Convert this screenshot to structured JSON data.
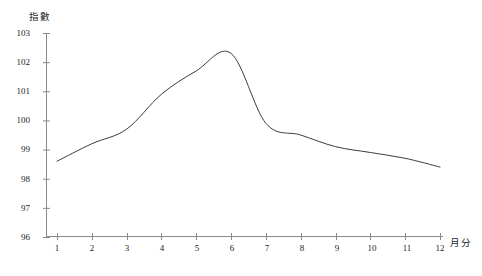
{
  "chart_data": {
    "type": "line",
    "title": "",
    "subtitle": "",
    "xlabel": "月分",
    "ylabel": "指數",
    "categories": [
      "1",
      "2",
      "3",
      "4",
      "5",
      "6",
      "7",
      "8",
      "9",
      "10",
      "11",
      "12"
    ],
    "x": [
      1,
      2,
      3,
      4,
      5,
      6,
      7,
      8,
      9,
      10,
      11,
      12
    ],
    "values": [
      98.6,
      99.2,
      99.7,
      100.9,
      101.7,
      102.3,
      99.9,
      99.5,
      99.1,
      98.9,
      98.7,
      98.4
    ],
    "series": [
      {
        "name": "指數",
        "values": [
          98.6,
          99.2,
          99.7,
          100.9,
          101.7,
          102.3,
          99.9,
          99.5,
          99.1,
          98.9,
          98.7,
          98.4
        ]
      }
    ],
    "ylim": [
      96,
      103
    ],
    "xlim": [
      1,
      12
    ],
    "ytick_labels": [
      "96",
      "97",
      "98",
      "99",
      "100",
      "101",
      "102",
      "103"
    ],
    "ytick_values": [
      96,
      97,
      98,
      99,
      100,
      101,
      102,
      103
    ],
    "xtick_labels": [
      "1",
      "2",
      "3",
      "4",
      "5",
      "6",
      "7",
      "8",
      "9",
      "10",
      "11",
      "12"
    ],
    "grid": false,
    "legend": false,
    "legend_position": "none",
    "line_color": "#3c3c3c",
    "axis_color": "#8a8a8a",
    "background_color": "#ffffff",
    "annotations": []
  },
  "axis": {
    "y_title": "指數",
    "x_title": "月分"
  }
}
